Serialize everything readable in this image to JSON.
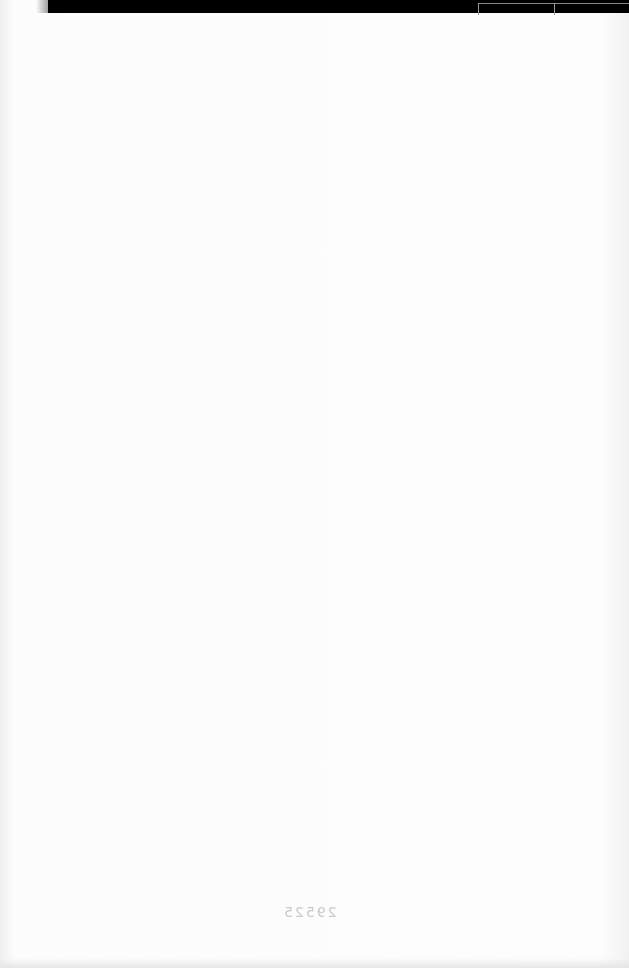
{
  "page": {
    "type": "scanned-blank-page",
    "bleed_through_number": "29525",
    "colors": {
      "paper": "#fbfbfb",
      "top_band": "#000000",
      "bleed_text": "#c9c9c9"
    }
  }
}
